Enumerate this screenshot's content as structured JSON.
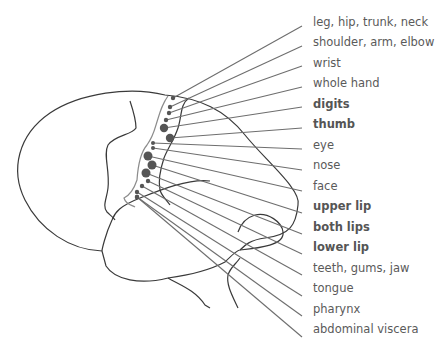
{
  "colors": {
    "outline": "#3a3a3a",
    "sulcus_gray": "#8c8c8c",
    "leader_line": "#6e6e6e",
    "dot": "#555555",
    "text": "#5a5a5a"
  },
  "labels": [
    {
      "text": "leg, hip, trunk, neck",
      "bold": false,
      "y": 22,
      "dot": [
        173,
        98,
        2.2
      ],
      "end": [
        302,
        26
      ]
    },
    {
      "text": "shoulder, arm, elbow",
      "bold": false,
      "y": 42,
      "dot": [
        170,
        107,
        2.2
      ],
      "end": [
        302,
        46
      ]
    },
    {
      "text": "wrist",
      "bold": false,
      "y": 63,
      "dot": [
        169,
        113,
        2.2
      ],
      "end": [
        302,
        66
      ]
    },
    {
      "text": "whole hand",
      "bold": false,
      "y": 83,
      "dot": [
        166,
        120,
        2.2
      ],
      "end": [
        302,
        87
      ]
    },
    {
      "text": "digits",
      "bold": true,
      "y": 104,
      "dot": [
        164,
        128,
        4.2
      ],
      "end": [
        302,
        107
      ]
    },
    {
      "text": "thumb",
      "bold": true,
      "y": 124,
      "dot": [
        170,
        138,
        4.2
      ],
      "end": [
        302,
        128
      ]
    },
    {
      "text": "eye",
      "bold": false,
      "y": 145,
      "dot": [
        153,
        143,
        2
      ],
      "end": [
        302,
        149
      ]
    },
    {
      "text": "nose",
      "bold": false,
      "y": 165,
      "dot": [
        153,
        148,
        2
      ],
      "end": [
        302,
        170
      ]
    },
    {
      "text": "face",
      "bold": false,
      "y": 186,
      "dot": [
        148,
        156,
        4.5
      ],
      "end": [
        302,
        191
      ]
    },
    {
      "text": "upper lip",
      "bold": true,
      "y": 206,
      "dot": [
        152,
        165,
        4.5
      ],
      "end": [
        302,
        213
      ]
    },
    {
      "text": "both lips",
      "bold": true,
      "y": 227,
      "dot": [
        146,
        173,
        4.5
      ],
      "end": [
        302,
        234
      ]
    },
    {
      "text": "lower lip",
      "bold": true,
      "y": 247,
      "dot": [
        148,
        181,
        2.2
      ],
      "end": [
        302,
        254
      ]
    },
    {
      "text": "teeth, gums, jaw",
      "bold": false,
      "y": 268,
      "dot": [
        142,
        186,
        2.2
      ],
      "end": [
        302,
        275
      ]
    },
    {
      "text": "tongue",
      "bold": false,
      "y": 288,
      "dot": [
        137,
        192,
        2.2
      ],
      "end": [
        302,
        296
      ]
    },
    {
      "text": "pharynx",
      "bold": false,
      "y": 309,
      "dot": [
        137,
        197,
        2.2
      ],
      "end": [
        302,
        316
      ]
    },
    {
      "text": "abdominal viscera",
      "bold": false,
      "y": 329,
      "dot": [
        137,
        197,
        2.2
      ],
      "end": [
        302,
        337
      ]
    }
  ]
}
